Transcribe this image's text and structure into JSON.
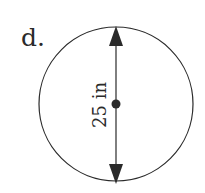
{
  "problem": {
    "label": "d.",
    "shape": "circle",
    "measurement": {
      "kind": "diameter",
      "text": "25 in",
      "value": 25,
      "unit": "in"
    }
  },
  "colors": {
    "stroke": "#2a2a2a",
    "background": "#ffffff"
  }
}
